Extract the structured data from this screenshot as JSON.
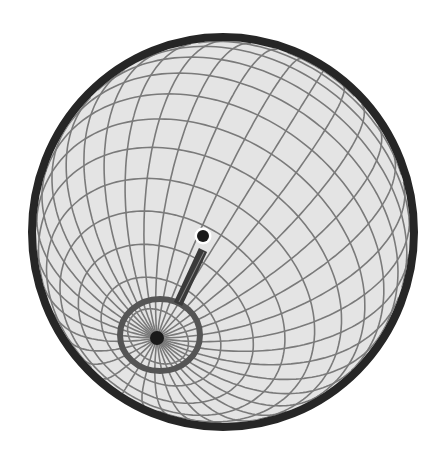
{
  "canvas": {
    "width": 443,
    "height": 461,
    "background": "#ffffff"
  },
  "globe": {
    "center": [
      223,
      232
    ],
    "rx": 187,
    "ry": 191,
    "fill": "#e4e4e4",
    "outline_color": "#262626",
    "outline_width": 8,
    "grid_color": "#7a7a7a",
    "grid_width": 1.6
  },
  "grid": {
    "pole_screen": [
      157,
      338
    ],
    "meridian_step_deg": 10,
    "parallel_step_deg": 10
  },
  "pole_ring": {
    "center": [
      160,
      335
    ],
    "rx": 40,
    "ry": 36,
    "stroke": "#555555",
    "stroke_width": 6
  },
  "pole_dot": {
    "center": [
      157,
      338
    ],
    "r": 7,
    "fill": "#1a1a1a"
  },
  "stem": {
    "from": [
      178,
      304
    ],
    "to": [
      203,
      250
    ],
    "width": 9,
    "color": "#3a3a3a",
    "highlight": "#8a8a8a"
  },
  "marker": {
    "center": [
      203,
      236
    ],
    "r": 6,
    "fill": "#1a1a1a",
    "halo_color": "#ffffff",
    "halo_width": 2.5
  },
  "labels": {
    "globe": "globe",
    "pole": "pole",
    "marker": "marker"
  }
}
